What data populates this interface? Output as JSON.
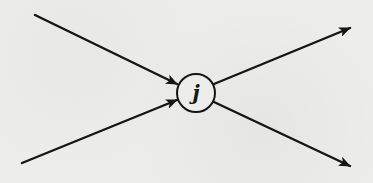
{
  "diagram": {
    "type": "flow-node",
    "node": {
      "label": "j",
      "center": [
        196,
        93
      ],
      "radius": 19
    },
    "edges": [
      {
        "id": "in-1",
        "direction": "incoming",
        "from": [
          35,
          15
        ],
        "to": [
          177,
          84
        ]
      },
      {
        "id": "in-2",
        "direction": "incoming",
        "from": [
          22,
          163
        ],
        "to": [
          177,
          100
        ]
      },
      {
        "id": "out-1",
        "direction": "outgoing",
        "from": [
          214,
          84
        ],
        "to": [
          350,
          28
        ]
      },
      {
        "id": "out-2",
        "direction": "outgoing",
        "from": [
          214,
          102
        ],
        "to": [
          350,
          166
        ]
      }
    ],
    "colors": {
      "stroke": "#151515",
      "background": "#ededeb"
    }
  }
}
